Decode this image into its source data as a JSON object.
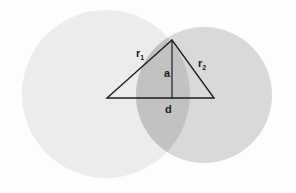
{
  "figure": {
    "background_color": "#fdfdfd",
    "width": 296,
    "height": 193
  },
  "colors": {
    "circle_left_fill": "#ececec",
    "circle_right_fill": "#d9d9d9",
    "lens_fill": "#c2c2c2",
    "line_stroke": "#1c1c1c",
    "label_color": "#1a1a1a"
  },
  "shapes": {
    "circle_left": {
      "name": "left-circle",
      "cx": 106,
      "cy": 94,
      "r": 84,
      "fill": "#ececec"
    },
    "circle_right": {
      "name": "right-circle",
      "cx": 204,
      "cy": 95,
      "r": 68,
      "fill": "#d9d9d9"
    },
    "triangle": {
      "name": "triangle",
      "apex": {
        "x": 172,
        "y": 40
      },
      "left_vertex": {
        "x": 107,
        "y": 98
      },
      "right_vertex": {
        "x": 214,
        "y": 98
      }
    },
    "altitude": {
      "name": "altitude-segment",
      "x": 172,
      "y_top": 40,
      "y_bottom": 98
    }
  },
  "labels": {
    "r1": {
      "base": "r",
      "subscript": "1",
      "x": 136,
      "y": 57
    },
    "r2": {
      "base": "r",
      "subscript": "2",
      "x": 198,
      "y": 67
    },
    "a": {
      "text": "a",
      "x": 164,
      "y": 77
    },
    "d": {
      "text": "d",
      "x": 165,
      "y": 113
    }
  },
  "legend": {
    "r1_meaning": "radius of left circle",
    "r2_meaning": "radius of right circle",
    "a_meaning": "half-chord height from center line to intersection point",
    "d_meaning": "distance between circle centers"
  }
}
